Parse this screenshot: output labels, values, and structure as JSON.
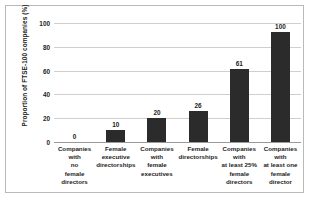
{
  "chart_data": {
    "type": "bar",
    "title": "",
    "xlabel": "",
    "ylabel": "Proportion of FTSE-100 companies (%)",
    "ylim": [
      0,
      100
    ],
    "yticks": [
      100,
      80,
      60,
      40,
      20,
      0
    ],
    "grid": true,
    "legend": false,
    "bar_color": "#2b2b2b",
    "categories": [
      "Companies with no female directors",
      "Female executive directorships",
      "Companies with female executives",
      "Female directorships",
      "Companies with at least 25% female directors",
      "Companies with at least one female director"
    ],
    "category_lines": [
      [
        "Companies",
        "with",
        "no",
        "female",
        "directors"
      ],
      [
        "Female",
        "executive",
        "directorships"
      ],
      [
        "Companies",
        "with",
        "female",
        "executives"
      ],
      [
        "Female",
        "directorships"
      ],
      [
        "Companies",
        "with",
        "at least 25%",
        "female",
        "directors"
      ],
      [
        "Companies",
        "with",
        "at least one",
        "female",
        "director"
      ]
    ],
    "values": [
      0,
      10,
      20,
      26,
      61,
      100
    ],
    "value_labels": [
      "0",
      "10",
      "20",
      "26",
      "61",
      "100"
    ]
  }
}
